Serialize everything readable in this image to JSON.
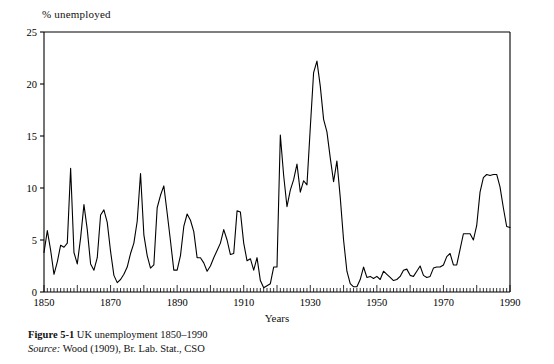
{
  "figure": {
    "label_bold": "Figure 5-1",
    "caption_text": "UK unemployment 1850–1990",
    "source_label": "Source:",
    "source_text": "Wood (1909), Br. Lab. Stat., CSO"
  },
  "axes": {
    "y_axis_title": "% unemployed",
    "x_axis_title": "Years",
    "y_ticks": [
      "0",
      "5",
      "10",
      "15",
      "20",
      "25"
    ],
    "x_ticks": [
      "1850",
      "1870",
      "1890",
      "1910",
      "1930",
      "1950",
      "1970",
      "1990"
    ]
  },
  "colors": {
    "line": "#000000",
    "axis": "#000000",
    "background": "#ffffff"
  },
  "chart_data": {
    "type": "line",
    "title": "UK unemployment 1850–1990",
    "xlabel": "Years",
    "ylabel": "% unemployed",
    "xlim": [
      1850,
      1990
    ],
    "ylim": [
      0,
      25
    ],
    "ytick_values": [
      0,
      5,
      10,
      15,
      20,
      25
    ],
    "xtick_values": [
      1850,
      1870,
      1890,
      1910,
      1930,
      1950,
      1970,
      1990
    ],
    "minor_xtick_interval": 1,
    "grid": false,
    "legend": "none",
    "series": [
      {
        "name": "UK unemployment rate (%)",
        "x": [
          1850,
          1851,
          1852,
          1853,
          1854,
          1855,
          1856,
          1857,
          1858,
          1859,
          1860,
          1861,
          1862,
          1863,
          1864,
          1865,
          1866,
          1867,
          1868,
          1869,
          1870,
          1871,
          1872,
          1873,
          1874,
          1875,
          1876,
          1877,
          1878,
          1879,
          1880,
          1881,
          1882,
          1883,
          1884,
          1885,
          1886,
          1887,
          1888,
          1889,
          1890,
          1891,
          1892,
          1893,
          1894,
          1895,
          1896,
          1897,
          1898,
          1899,
          1900,
          1901,
          1902,
          1903,
          1904,
          1905,
          1906,
          1907,
          1908,
          1909,
          1910,
          1911,
          1912,
          1913,
          1914,
          1915,
          1916,
          1917,
          1918,
          1919,
          1920,
          1921,
          1922,
          1923,
          1924,
          1925,
          1926,
          1927,
          1928,
          1929,
          1930,
          1931,
          1932,
          1933,
          1934,
          1935,
          1936,
          1937,
          1938,
          1939,
          1940,
          1941,
          1942,
          1943,
          1944,
          1945,
          1946,
          1947,
          1948,
          1949,
          1950,
          1951,
          1952,
          1953,
          1954,
          1955,
          1956,
          1957,
          1958,
          1959,
          1960,
          1961,
          1962,
          1963,
          1964,
          1965,
          1966,
          1967,
          1968,
          1969,
          1970,
          1971,
          1972,
          1973,
          1974,
          1975,
          1976,
          1977,
          1978,
          1979,
          1980,
          1981,
          1982,
          1983,
          1984,
          1985,
          1986,
          1987,
          1988,
          1989,
          1990
        ],
        "values": [
          3.8,
          5.9,
          4.0,
          1.7,
          2.9,
          4.5,
          4.3,
          4.7,
          11.9,
          3.8,
          2.7,
          5.2,
          8.4,
          6.0,
          2.7,
          2.1,
          3.3,
          7.4,
          7.9,
          6.7,
          3.9,
          1.6,
          0.9,
          1.2,
          1.7,
          2.4,
          3.7,
          4.7,
          6.8,
          11.4,
          5.5,
          3.5,
          2.3,
          2.6,
          8.1,
          9.3,
          10.2,
          7.6,
          4.9,
          2.1,
          2.1,
          3.5,
          6.3,
          7.5,
          6.9,
          5.8,
          3.3,
          3.3,
          2.8,
          2.0,
          2.5,
          3.3,
          4.0,
          4.7,
          6.0,
          5.0,
          3.6,
          3.7,
          7.8,
          7.7,
          4.7,
          3.0,
          3.2,
          2.1,
          3.3,
          1.1,
          0.4,
          0.6,
          0.8,
          2.4,
          2.4,
          15.1,
          11.2,
          8.2,
          9.8,
          10.8,
          12.3,
          9.6,
          10.7,
          10.3,
          15.8,
          21.1,
          22.2,
          19.8,
          16.6,
          15.4,
          12.9,
          10.6,
          12.6,
          9.1,
          5.0,
          2.0,
          0.8,
          0.5,
          0.5,
          1.2,
          2.4,
          1.4,
          1.5,
          1.3,
          1.5,
          1.2,
          2.0,
          1.7,
          1.4,
          1.1,
          1.2,
          1.5,
          2.1,
          2.2,
          1.6,
          1.5,
          2.0,
          2.5,
          1.6,
          1.4,
          1.5,
          2.3,
          2.4,
          2.4,
          2.6,
          3.4,
          3.7,
          2.6,
          2.6,
          4.1,
          5.6,
          5.6,
          5.6,
          5.0,
          6.4,
          9.6,
          11.0,
          11.3,
          11.2,
          11.3,
          11.3,
          10.1,
          8.1,
          6.3,
          6.2
        ]
      }
    ]
  }
}
